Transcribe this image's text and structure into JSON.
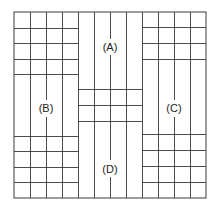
{
  "diagram": {
    "title": "",
    "regions": [
      {
        "id": "A",
        "label": "(A)",
        "position": "top-center",
        "x": 110,
        "y": 49
      },
      {
        "id": "B",
        "label": "(B)",
        "position": "middle-left",
        "x": 46,
        "y": 110
      },
      {
        "id": "C",
        "label": "(C)",
        "position": "middle-right",
        "x": 174,
        "y": 110
      },
      {
        "id": "D",
        "label": "(D)",
        "position": "bottom-center",
        "x": 110,
        "y": 171
      }
    ],
    "colors": {
      "line": "#3a3a3a",
      "text": "#222222",
      "background": "#ffffff"
    }
  }
}
